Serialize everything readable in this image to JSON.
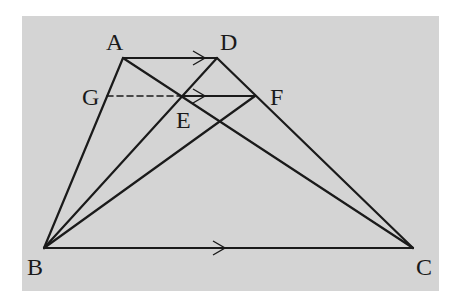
{
  "diagram": {
    "type": "geometry",
    "background": "#d4d4d4",
    "page_background": "#ffffff",
    "line_color": "#1a1a1a",
    "panel": {
      "x": 22,
      "y": 16,
      "width": 417,
      "height": 275
    },
    "points": {
      "A": {
        "x": 123,
        "y": 58,
        "label": "A",
        "lx": 106,
        "ly": 50
      },
      "D": {
        "x": 217,
        "y": 58,
        "label": "D",
        "lx": 220,
        "ly": 50
      },
      "G": {
        "x": 107,
        "y": 96,
        "label": "G",
        "lx": 82,
        "ly": 105
      },
      "E": {
        "x": 182,
        "y": 96,
        "label": "E",
        "lx": 176,
        "ly": 128
      },
      "F": {
        "x": 255,
        "y": 96,
        "label": "F",
        "lx": 270,
        "ly": 105
      },
      "B": {
        "x": 44,
        "y": 248,
        "label": "B",
        "lx": 27,
        "ly": 275
      },
      "C": {
        "x": 413,
        "y": 248,
        "label": "C",
        "lx": 416,
        "ly": 275
      }
    },
    "segments": [
      {
        "from": "A",
        "to": "D",
        "style": "solid",
        "arrow_at": {
          "x": 205,
          "y": 58
        }
      },
      {
        "from": "A",
        "to": "B",
        "style": "solid"
      },
      {
        "from": "A",
        "to": "C",
        "style": "solid"
      },
      {
        "from": "D",
        "to": "B",
        "style": "solid"
      },
      {
        "from": "D",
        "to": "C",
        "style": "solid"
      },
      {
        "from": "F",
        "to": "B",
        "style": "solid"
      },
      {
        "from": "B",
        "to": "C",
        "style": "solid",
        "arrow_at": {
          "x": 225,
          "y": 248
        }
      },
      {
        "from": "G",
        "to": "E",
        "style": "dashed"
      },
      {
        "from": "E",
        "to": "F",
        "style": "solid",
        "arrow_at": {
          "x": 205,
          "y": 96
        }
      }
    ],
    "labels": [
      "A",
      "D",
      "G",
      "E",
      "F",
      "B",
      "C"
    ],
    "parallel_marks": [
      "AD",
      "EF",
      "BC"
    ]
  }
}
